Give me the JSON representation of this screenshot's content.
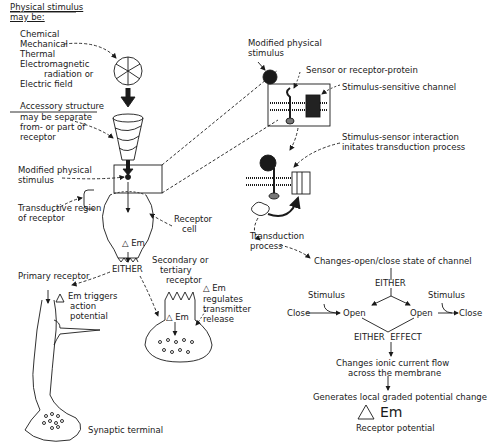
{
  "left": {
    "stimulus_header": [
      "Physical stimulus",
      "may be:"
    ],
    "stimulus_types": [
      "Chemical",
      "Mechanical",
      "Thermal",
      "Electromagnetic",
      "radiation or",
      "Electric field"
    ],
    "accessory_header": "Accessory structure",
    "accessory_desc": [
      "may be separate",
      "from- or part of",
      "receptor"
    ],
    "modified_stimulus": [
      "Modified physical",
      "stimulus"
    ],
    "transductive_region": [
      "Transductive region",
      "of receptor"
    ],
    "receptor_cell": [
      "Receptor",
      "cell"
    ],
    "delta_em": "Em",
    "either": "EITHER",
    "primary_receptor": "Primary receptor",
    "primary_effect": [
      "Em triggers",
      "action",
      "potential"
    ],
    "secondary_receptor": [
      "Secondary or",
      "tertiary",
      "receptor"
    ],
    "secondary_effect": [
      "Em",
      "regulates",
      "transmitter",
      "release"
    ],
    "synaptic_terminal": "Synaptic terminal"
  },
  "right": {
    "modified_stimulus": [
      "Modified physical",
      "stimulus"
    ],
    "sensor": "Sensor or receptor-protein",
    "channel": "Stimulus-sensitive channel",
    "interaction": [
      "Stimulus-sensor interaction",
      "initates transduction process"
    ],
    "transduction": [
      "Transduction",
      "process"
    ],
    "changes_state": "Changes-open/close state of channel",
    "either": "EITHER",
    "stimulus_left": "Stimulus",
    "stimulus_right": "Stimulus",
    "close_left": "Close",
    "open_left": "Open",
    "open_right": "Open",
    "close_right": "Close",
    "either_effect": "EITHER  EFFECT",
    "ionic_flow": [
      "Changes ionic current flow",
      "across the membrane"
    ],
    "graded_potential": "Generates local graded potential change",
    "em": "Em",
    "receptor_potential": "Receptor potential"
  }
}
